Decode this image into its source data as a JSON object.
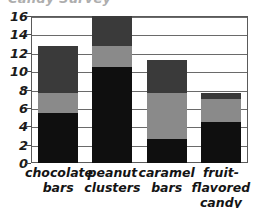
{
  "chart_data": {
    "type": "bar",
    "subtype": "stacked",
    "title": "Candy Survey",
    "title_clipped": true,
    "xlabel": "",
    "ylabel": "",
    "ylim": [
      0,
      16
    ],
    "yticks": [
      0,
      2,
      4,
      6,
      8,
      10,
      12,
      14,
      16
    ],
    "ytick_labels": [
      "0",
      "2",
      "4",
      "6",
      "8",
      "10",
      "12",
      "14",
      "16"
    ],
    "grid": true,
    "legend": "none",
    "categories": [
      "chocolate\nbars",
      "peanut\nclusters",
      "caramel\nbars",
      "fruit-flavored\ncandy bars"
    ],
    "series": [
      {
        "name": "bottom-segment",
        "color": "#0f0f0f",
        "values": [
          5.4,
          10.4,
          2.6,
          4.5
        ]
      },
      {
        "name": "middle-segment",
        "color": "#8a8a8a",
        "values": [
          2.2,
          2.3,
          5.0,
          2.5
        ]
      },
      {
        "name": "top-segment",
        "color": "#3a3a3a",
        "values": [
          5.1,
          3.3,
          3.6,
          0.6
        ]
      }
    ],
    "totals": [
      12.7,
      16.0,
      11.2,
      7.6
    ]
  },
  "colors": {
    "bottom": "#0f0f0f",
    "middle": "#8a8a8a",
    "top": "#3a3a3a",
    "axis": "#5a5a5a",
    "grid": "#6a6a6a",
    "text": "#141414",
    "background": "#ffffff"
  }
}
